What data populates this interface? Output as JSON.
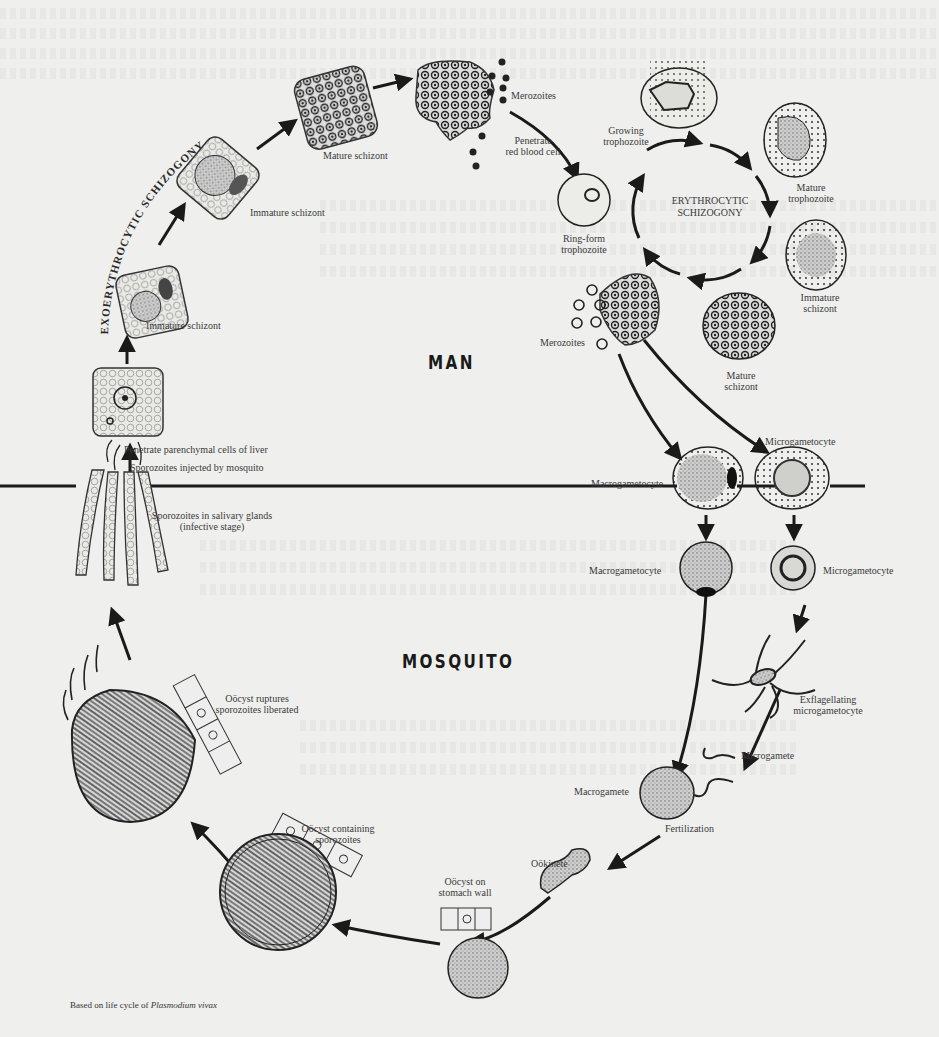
{
  "regions": {
    "man": "MAN",
    "mosquito": "MOSQUITO"
  },
  "cycles": {
    "exoerythrocytic": "EXOERYTHROCYTIC SCHIZOGONY",
    "erythrocytic_line1": "ERYTHROCYTIC",
    "erythrocytic_line2": "SCHIZOGONY"
  },
  "stages": {
    "penetrate_liver": "Penetrate parenchymal cells of liver",
    "immature_schizont_1": "Immature schizont",
    "immature_schizont_2": "Immature schizont",
    "mature_schizont_liver": "Mature schizont",
    "merozoites_liver": "Merozoites",
    "penetrate_rbc_1": "Penetrate",
    "penetrate_rbc_2": "red blood cell",
    "ring_form_1": "Ring-form",
    "ring_form_2": "trophozoite",
    "growing_troph_1": "Growing",
    "growing_troph_2": "trophozoite",
    "mature_troph_1": "Mature",
    "mature_troph_2": "trophozoite",
    "immature_schizont_rbc_1": "Immature",
    "immature_schizont_rbc_2": "schizont",
    "mature_schizont_rbc_1": "Mature",
    "mature_schizont_rbc_2": "schizont",
    "merozoites_rbc": "Merozoites",
    "macrogametocyte_man": "Macrogametocyte",
    "microgametocyte_man": "Microgametocyte",
    "macrogametocyte_mosq": "Macrogametocyte",
    "microgametocyte_mosq": "Microgametocyte",
    "exflag_1": "Exflagellating",
    "exflag_2": "microgametocyte",
    "microgamete": "Microgamete",
    "macrogamete": "Macrogamete",
    "fertilization": "Fertilization",
    "ookinete": "Oökinete",
    "oocyst_wall_1": "Oöcyst on",
    "oocyst_wall_2": "stomach wall",
    "oocyst_containing_1": "Oöcyst containing",
    "oocyst_containing_2": "sporozoites",
    "oocyst_ruptures_1": "Oöcyst ruptures",
    "oocyst_ruptures_2": "sporozoites liberated",
    "sporozoites_salivary_1": "Sporozoites in salivary glands",
    "sporozoites_salivary_2": "(infective stage)",
    "sporozoites_injected": "Sporozoites injected by mosquito"
  },
  "caption": {
    "prefix": "Based on life cycle of ",
    "species": "Plasmodium vivax"
  }
}
